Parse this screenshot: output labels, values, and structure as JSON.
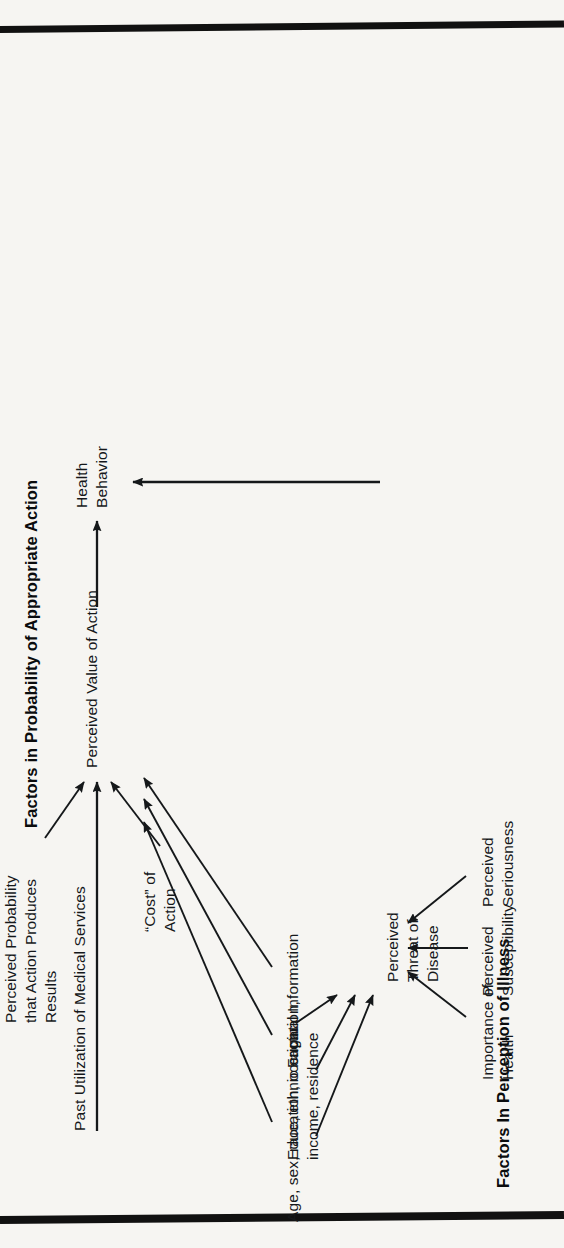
{
  "document": {
    "kind": "health-belief-model-diagram",
    "background_color": "#f6f5f2",
    "ink_color": "#15181a"
  },
  "headings": {
    "left": "Factors In Perception of Illness",
    "right": "Factors in Probability of Appropriate Action"
  },
  "nodes": {
    "demographics": "Age, sex, race, ethnic origin",
    "sociopsych": "Education, occupation,\nincome, residence",
    "factual": "Factual Information",
    "threat": "Perceived\nThreat of\nDisease",
    "importance": "Importance of\nHealth",
    "susceptibility": "Perceived\nSusceptibility",
    "seriousness": "Perceived\nSeriousness",
    "past_use": "Past Utilization of Medical Services",
    "probability": "Perceived Probability\nthat Action Produces\nResults",
    "cost": "“Cost” of\nAction",
    "value": "Perceived Value of Action",
    "behavior": "Health\nBehavior"
  },
  "edges": [
    {
      "from": "demographics",
      "to": "threat"
    },
    {
      "from": "sociopsych",
      "to": "threat"
    },
    {
      "from": "factual",
      "to": "threat"
    },
    {
      "from": "importance",
      "to": "threat"
    },
    {
      "from": "susceptibility",
      "to": "threat"
    },
    {
      "from": "seriousness",
      "to": "threat"
    },
    {
      "from": "demographics",
      "to": "value"
    },
    {
      "from": "sociopsych",
      "to": "value"
    },
    {
      "from": "factual",
      "to": "value"
    },
    {
      "from": "past_use",
      "to": "value"
    },
    {
      "from": "probability",
      "to": "value"
    },
    {
      "from": "cost",
      "to": "value"
    },
    {
      "from": "value",
      "to": "behavior"
    },
    {
      "from": "threat",
      "to": "behavior"
    }
  ]
}
